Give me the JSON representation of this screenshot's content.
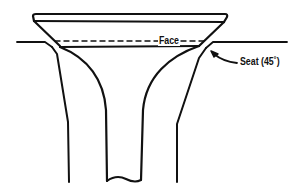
{
  "diagram": {
    "type": "valve cross-section",
    "labels": {
      "face": "Face",
      "seat": "Seat (45˚)"
    },
    "colors": {
      "line": "#111111",
      "background": "#ffffff"
    },
    "icons": {
      "seat_pointer": "curved-arrow-icon"
    }
  }
}
